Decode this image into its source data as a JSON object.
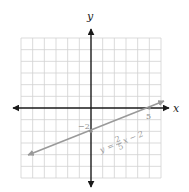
{
  "graph": {
    "x_axis_label": "x",
    "y_axis_label": "y",
    "y_intercept_label": "−2",
    "x_intercept_label": "5",
    "equation": {
      "lhs": "y",
      "equals": "=",
      "numerator": "2",
      "denominator": "5",
      "rest": "x − 2"
    },
    "grid": {
      "x_min": -6,
      "x_max": 6,
      "y_min": -6,
      "y_max": 6
    },
    "line": {
      "slope": "2/5",
      "intercept": -2
    },
    "colors": {
      "axis": "#1a1a1a",
      "grid": "#d2d2d2",
      "line": "#9a9a9a"
    }
  }
}
